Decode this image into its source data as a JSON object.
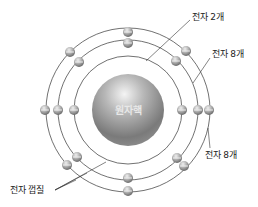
{
  "diagram": {
    "type": "bohr-atom-model",
    "nucleus": {
      "label": "원자핵",
      "cx": 128,
      "cy": 110,
      "r": 36
    },
    "shells": [
      {
        "index": 1,
        "r": 54,
        "electron_count": 2,
        "label": "전자 2개"
      },
      {
        "index": 2,
        "r": 70,
        "electron_count": 8,
        "label": "전자 8개"
      },
      {
        "index": 3,
        "r": 82,
        "electron_count": 8,
        "label": "전자 8개"
      }
    ],
    "shell_label": "전자 껍질",
    "colors": {
      "orbit_line": "#333333",
      "leader_line": "#333333",
      "nucleus_light": "#f2f2f2",
      "nucleus_dark": "#6a6a6a",
      "electron_light": "#ededed",
      "electron_dark": "#5a5a5a",
      "text": "#222222"
    }
  },
  "labels": {
    "shell1_electrons": "전자 2개",
    "shell2_electrons": "전자 8개",
    "shell3_electrons": "전자 8개",
    "electron_shell": "전자 껍질",
    "nucleus": "원자핵"
  }
}
